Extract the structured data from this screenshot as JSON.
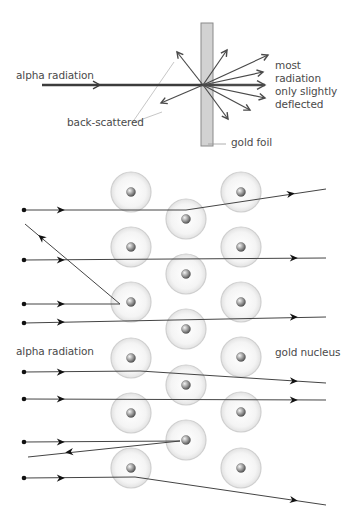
{
  "top_diagram": {
    "labels": {
      "alpha_radiation": "alpha radiation",
      "most_radiation": "most radiation\nonly slightly\ndeflected",
      "back_scattered": "back-scattered",
      "gold_foil": "gold foil"
    },
    "foil": {
      "x": 201,
      "y": 23,
      "width": 12,
      "height": 123,
      "fill": "#d2d2d2",
      "stroke": "#8a8a8a"
    },
    "origin": [
      203,
      85
    ],
    "incoming": {
      "from": [
        42,
        85
      ],
      "to": [
        203,
        85
      ]
    },
    "scatter_arrows": [
      {
        "name": "back-up-left",
        "to": [
          177,
          52
        ]
      },
      {
        "name": "back-down-left",
        "to": [
          161,
          103
        ]
      },
      {
        "name": "up-right",
        "to": [
          227,
          50
        ]
      },
      {
        "name": "right-up-1",
        "to": [
          268,
          55
        ]
      },
      {
        "name": "right-up-2",
        "to": [
          263,
          72
        ]
      },
      {
        "name": "right-main",
        "to": [
          265,
          85
        ],
        "thick": true
      },
      {
        "name": "right-down-1",
        "to": [
          265,
          98
        ]
      },
      {
        "name": "right-down-2",
        "to": [
          250,
          110
        ]
      },
      {
        "name": "down-right",
        "to": [
          228,
          119
        ]
      }
    ]
  },
  "bottom_diagram": {
    "labels": {
      "alpha_radiation": "alpha radiation",
      "gold_nucleus": "gold nucleus"
    },
    "atom_radius": 20,
    "nucleus_radius": 4.5,
    "atoms": [
      [
        131,
        192
      ],
      [
        241,
        192
      ],
      [
        186,
        219
      ],
      [
        131,
        247
      ],
      [
        241,
        247
      ],
      [
        186,
        274
      ],
      [
        131,
        302
      ],
      [
        241,
        302
      ],
      [
        186,
        329
      ],
      [
        131,
        358
      ],
      [
        241,
        357
      ],
      [
        186,
        385
      ],
      [
        131,
        413
      ],
      [
        241,
        412
      ],
      [
        186,
        440
      ],
      [
        131,
        468
      ],
      [
        241,
        468
      ]
    ],
    "paths": [
      {
        "name": "path-1-deflected-up",
        "points": [
          [
            24,
            210
          ],
          [
            186,
            210
          ],
          [
            326,
            189
          ]
        ],
        "arrows": [
          [
            60,
            210
          ],
          [
            290,
            194
          ]
        ]
      },
      {
        "name": "path-2-back-scattered",
        "points": [
          [
            24,
            260
          ],
          [
            200,
            260
          ]
        ],
        "arrows": [
          [
            60,
            260
          ]
        ],
        "note": "straight"
      },
      {
        "name": "path-2-straight",
        "points": [
          [
            24,
            260
          ],
          [
            326,
            258
          ]
        ],
        "arrows": [
          [
            60,
            260
          ],
          [
            293,
            258
          ]
        ]
      },
      {
        "name": "path-3-reflected",
        "points": [
          [
            24,
            304
          ],
          [
            120,
            304
          ],
          [
            25,
            224
          ]
        ],
        "arrows": [
          [
            60,
            304
          ],
          [
            42,
            238
          ]
        ]
      },
      {
        "name": "path-4-straight",
        "points": [
          [
            24,
            323
          ],
          [
            326,
            317
          ]
        ],
        "arrows": [
          [
            60,
            322
          ],
          [
            293,
            317
          ]
        ]
      },
      {
        "name": "path-5-deflected-down",
        "points": [
          [
            24,
            372
          ],
          [
            140,
            371
          ],
          [
            326,
            383
          ]
        ],
        "arrows": [
          [
            60,
            372
          ],
          [
            293,
            381
          ]
        ]
      },
      {
        "name": "path-6-straight",
        "points": [
          [
            24,
            399
          ],
          [
            326,
            400
          ]
        ],
        "arrows": [
          [
            60,
            399
          ],
          [
            293,
            400
          ]
        ]
      },
      {
        "name": "path-7-reflected",
        "points": [
          [
            24,
            442
          ],
          [
            180,
            441
          ],
          [
            28,
            457
          ]
        ],
        "arrows": [
          [
            60,
            442
          ],
          [
            70,
            452
          ]
        ]
      },
      {
        "name": "path-8-deflected-down",
        "points": [
          [
            24,
            478
          ],
          [
            135,
            477
          ],
          [
            326,
            505
          ]
        ],
        "arrows": [
          [
            60,
            478
          ],
          [
            293,
            500
          ]
        ]
      }
    ]
  }
}
